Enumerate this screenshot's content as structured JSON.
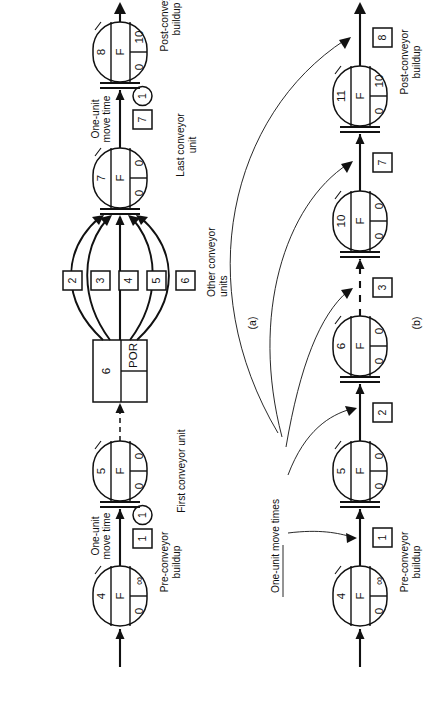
{
  "figure": {
    "panels": [
      {
        "id": "a",
        "caption": "(a)",
        "labels": {
          "pre_conveyor_buildup": "Pre-conveyor\nbuildup",
          "pre_conveyor_buildup_l1": "Pre-conveyor",
          "pre_conveyor_buildup_l2": "buildup",
          "post_conveyor_buildup_l1": "Post-conveyor",
          "post_conveyor_buildup_l2": "buildup",
          "one_unit_move_time_l1": "One-unit",
          "one_unit_move_time_l2": "move time",
          "first_conveyor_unit": "First conveyor unit",
          "last_conveyor_unit_l1": "Last conveyor",
          "last_conveyor_unit_l2": "unit",
          "other_conveyor_units_l1": "Other conveyor",
          "other_conveyor_units_l2": "units"
        },
        "nodes": [
          {
            "name": "queue-node-4",
            "top": "4",
            "mid": "F",
            "left": "0",
            "right": "∞"
          },
          {
            "name": "queue-node-5",
            "top": "5",
            "mid": "F",
            "left": "0",
            "right": "0"
          },
          {
            "name": "queue-node-7",
            "top": "7",
            "mid": "F",
            "left": "0",
            "right": "0"
          },
          {
            "name": "queue-node-8",
            "top": "8",
            "mid": "F",
            "left": "0",
            "right": "10"
          }
        ],
        "select_node": {
          "name": "select-node-6",
          "top": "6",
          "rule": "POR"
        },
        "activity_squares": [
          "1",
          "2",
          "3",
          "4",
          "5",
          "6",
          "7"
        ],
        "activity_circles": [
          "1",
          "1"
        ]
      },
      {
        "id": "b",
        "caption": "(b)",
        "labels": {
          "pre_conveyor_buildup_l1": "Pre-conveyor",
          "pre_conveyor_buildup_l2": "buildup",
          "post_conveyor_buildup_l1": "Post-conveyor",
          "post_conveyor_buildup_l2": "buildup",
          "one_unit_move_times": "One-unit move times"
        },
        "nodes": [
          {
            "name": "queue-node-4",
            "top": "4",
            "mid": "F",
            "left": "0",
            "right": "∞"
          },
          {
            "name": "queue-node-5",
            "top": "5",
            "mid": "F",
            "left": "0",
            "right": "0"
          },
          {
            "name": "queue-node-6",
            "top": "6",
            "mid": "F",
            "left": "0",
            "right": "0"
          },
          {
            "name": "queue-node-10",
            "top": "10",
            "mid": "F",
            "left": "0",
            "right": "0"
          },
          {
            "name": "queue-node-11",
            "top": "11",
            "mid": "F",
            "left": "0",
            "right": "10"
          }
        ],
        "activity_squares": [
          "1",
          "2",
          "3",
          "7",
          "8"
        ]
      }
    ],
    "colors": {
      "ink": "#111111",
      "paper": "#ffffff"
    }
  }
}
